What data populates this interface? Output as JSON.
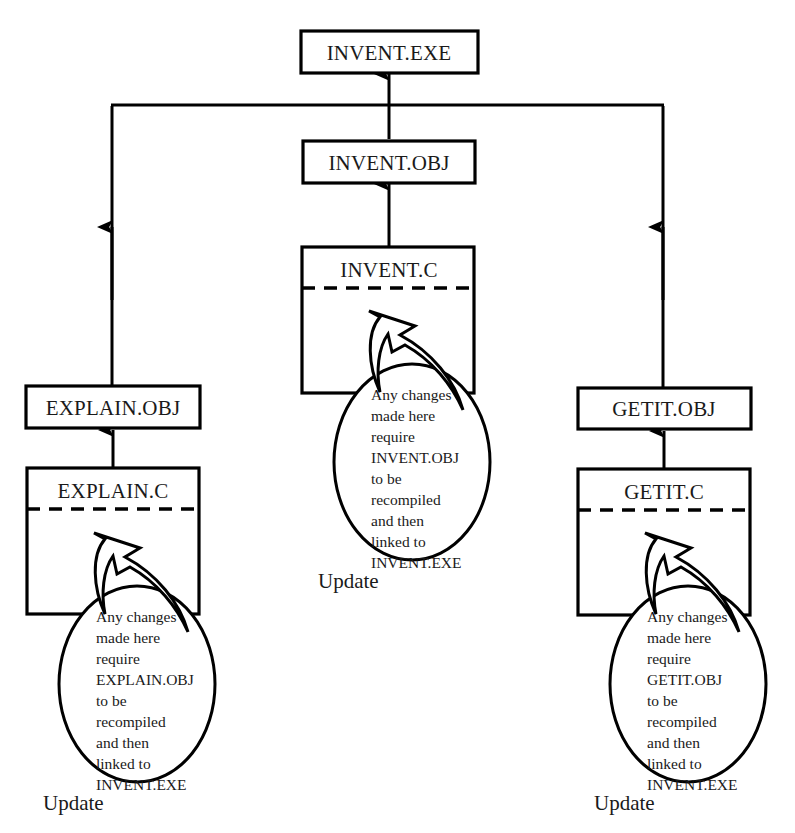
{
  "diagram": {
    "colors": {
      "stroke": "#000000",
      "fill": "#ffffff",
      "text": "#1a1a1a"
    },
    "nodes": {
      "invent_exe": {
        "label": "INVENT.EXE"
      },
      "invent_obj": {
        "label": "INVENT.OBJ"
      },
      "invent_c": {
        "label": "INVENT.C"
      },
      "explain_obj": {
        "label": "EXPLAIN.OBJ"
      },
      "explain_c": {
        "label": "EXPLAIN.C"
      },
      "getit_obj": {
        "label": "GETIT.OBJ"
      },
      "getit_c": {
        "label": "GETIT.C"
      }
    },
    "callouts": {
      "explain": {
        "lines": [
          "Any changes",
          "made here",
          "require",
          "EXPLAIN.OBJ",
          "to be",
          "recompiled",
          "and then",
          "linked to",
          "INVENT.EXE"
        ],
        "update_label": "Update"
      },
      "invent": {
        "lines": [
          "Any changes",
          "made here",
          "require",
          "INVENT.OBJ",
          "to be",
          "recompiled",
          "and then",
          "linked to",
          "INVENT.EXE"
        ],
        "update_label": "Update"
      },
      "getit": {
        "lines": [
          "Any changes",
          "made here",
          "require",
          "GETIT.OBJ",
          "to be",
          "recompiled",
          "and then",
          "linked to",
          "INVENT.EXE"
        ],
        "update_label": "Update"
      }
    }
  }
}
